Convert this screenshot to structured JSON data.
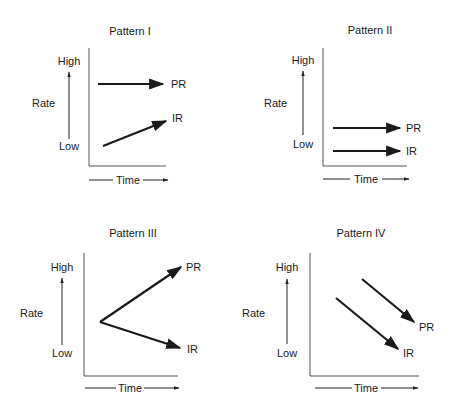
{
  "labels": {
    "high": "High",
    "low": "Low",
    "rate": "Rate",
    "time": "Time",
    "pr": "PR",
    "ir": "IR"
  },
  "panels": [
    {
      "title": "Pattern I",
      "description": "PR stays high and constant; IR rises from low toward PR",
      "series": [
        {
          "name": "PR",
          "trend": "flat-high"
        },
        {
          "name": "IR",
          "trend": "rising"
        }
      ]
    },
    {
      "title": "Pattern II",
      "description": "Both PR and IR stay low and constant, PR slightly above IR",
      "series": [
        {
          "name": "PR",
          "trend": "flat-low"
        },
        {
          "name": "IR",
          "trend": "flat-lowest"
        }
      ]
    },
    {
      "title": "Pattern III",
      "description": "PR and IR start at the same mid point; PR rises, IR falls",
      "series": [
        {
          "name": "PR",
          "trend": "rising"
        },
        {
          "name": "IR",
          "trend": "falling"
        }
      ]
    },
    {
      "title": "Pattern IV",
      "description": "Both PR and IR decline in parallel, PR above IR",
      "series": [
        {
          "name": "PR",
          "trend": "falling"
        },
        {
          "name": "IR",
          "trend": "falling"
        }
      ]
    }
  ],
  "colors": {
    "ink": "#1a1a1a",
    "axis": "#555555",
    "background": "#ffffff"
  }
}
